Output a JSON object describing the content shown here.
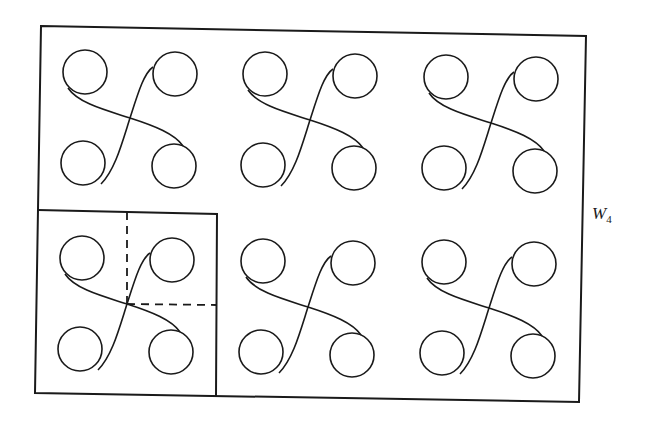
{
  "diagram": {
    "label": {
      "main": "W",
      "subscript": "4"
    },
    "colors": {
      "stroke": "#1a1a1a",
      "background": "#ffffff"
    },
    "grid": {
      "rows": 2,
      "columns": 3
    },
    "cell_motif": "four circles connected by two crossing S-curves",
    "highlighted_cell": {
      "row": 2,
      "column": 1,
      "boxed": true,
      "dashed_quadrant_lines": true
    }
  }
}
